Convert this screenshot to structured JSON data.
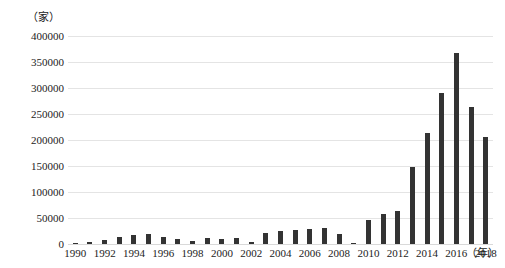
{
  "chart_data": {
    "type": "bar",
    "title": "",
    "subtitle": "",
    "xlabel": "（年）",
    "ylabel": "（家）",
    "y_unit_label": "（家）",
    "x_unit_label": "（年）",
    "grid": true,
    "legend": false,
    "ylim": [
      0,
      400000
    ],
    "ytick_step": 50000,
    "ytick_labels": [
      "400000",
      "350000",
      "300000",
      "250000",
      "200000",
      "150000",
      "100000",
      "50000",
      "0"
    ],
    "ytick_values": [
      400000,
      350000,
      300000,
      250000,
      200000,
      150000,
      100000,
      50000,
      0
    ],
    "categories": [
      "1990",
      "1991",
      "1992",
      "1993",
      "1994",
      "1995",
      "1996",
      "1997",
      "1998",
      "1999",
      "2000",
      "2001",
      "2002",
      "2003",
      "2004",
      "2005",
      "2006",
      "2007",
      "2008",
      "2009",
      "2010",
      "2011",
      "2012",
      "2013",
      "2014",
      "2015",
      "2016",
      "2017",
      "2018"
    ],
    "xtick_labels_shown": [
      "1990",
      "1992",
      "1994",
      "1996",
      "1998",
      "2000",
      "2002",
      "2004",
      "2006",
      "2008",
      "2010",
      "2012",
      "2014",
      "2016",
      "2018"
    ],
    "values": [
      2000,
      4000,
      7000,
      13000,
      17000,
      19000,
      13000,
      10000,
      5000,
      11000,
      9000,
      12000,
      4000,
      22000,
      25000,
      26000,
      28000,
      30000,
      19000,
      2000,
      47000,
      57000,
      63000,
      148000,
      213000,
      290000,
      367000,
      263000,
      205000
    ],
    "bar_color": "#333333",
    "grid_color": "#e4e4e4",
    "background_color": "#ffffff"
  }
}
